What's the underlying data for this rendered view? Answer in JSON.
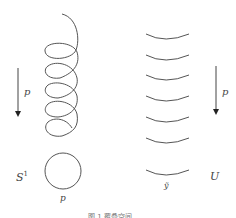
{
  "figure": {
    "left": {
      "arrow_label": "p",
      "space_label": "S",
      "space_sup": "1",
      "bottom_label": "p"
    },
    "right": {
      "arrow_label": "p",
      "space_label": "U",
      "bottom_label": "ỹ"
    },
    "caption": "图 1  覆叠空间"
  }
}
